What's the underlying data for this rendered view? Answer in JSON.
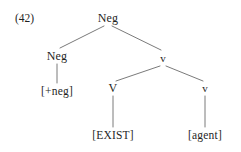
{
  "figure": {
    "example_number": "(42)",
    "line_color": "#6b6b6b",
    "text_color": "#1f1f1f",
    "background_color": "#ffffff"
  },
  "tree": {
    "nodes": {
      "root": {
        "label": "Neg",
        "x": 108,
        "y": 18
      },
      "neg_left": {
        "label": "Neg",
        "x": 57,
        "y": 56
      },
      "neg_feature": {
        "label": "[+neg]",
        "x": 57,
        "y": 92
      },
      "little_v_top": {
        "label": "v",
        "x": 163,
        "y": 58
      },
      "big_v": {
        "label": "V",
        "x": 113,
        "y": 88
      },
      "little_v_low": {
        "label": "v",
        "x": 205,
        "y": 88
      },
      "exist": {
        "label": "[EXIST]",
        "x": 113,
        "y": 136
      },
      "agent": {
        "label": "[agent]",
        "x": 205,
        "y": 136
      }
    },
    "edges": [
      {
        "from": "root",
        "to": "neg_left",
        "x1": 104,
        "y1": 26,
        "x2": 60,
        "y2": 48
      },
      {
        "from": "root",
        "to": "little_v_top",
        "x1": 112,
        "y1": 26,
        "x2": 161,
        "y2": 50
      },
      {
        "from": "neg_left",
        "to": "neg_feature",
        "x1": 57,
        "y1": 64,
        "x2": 57,
        "y2": 83
      },
      {
        "from": "little_v_top",
        "to": "big_v",
        "x1": 160,
        "y1": 66,
        "x2": 116,
        "y2": 81
      },
      {
        "from": "little_v_top",
        "to": "little_v_low",
        "x1": 166,
        "y1": 66,
        "x2": 203,
        "y2": 81
      },
      {
        "from": "big_v",
        "to": "exist",
        "x1": 113,
        "y1": 96,
        "x2": 113,
        "y2": 127
      },
      {
        "from": "little_v_low",
        "to": "agent",
        "x1": 205,
        "y1": 96,
        "x2": 205,
        "y2": 127
      }
    ]
  }
}
